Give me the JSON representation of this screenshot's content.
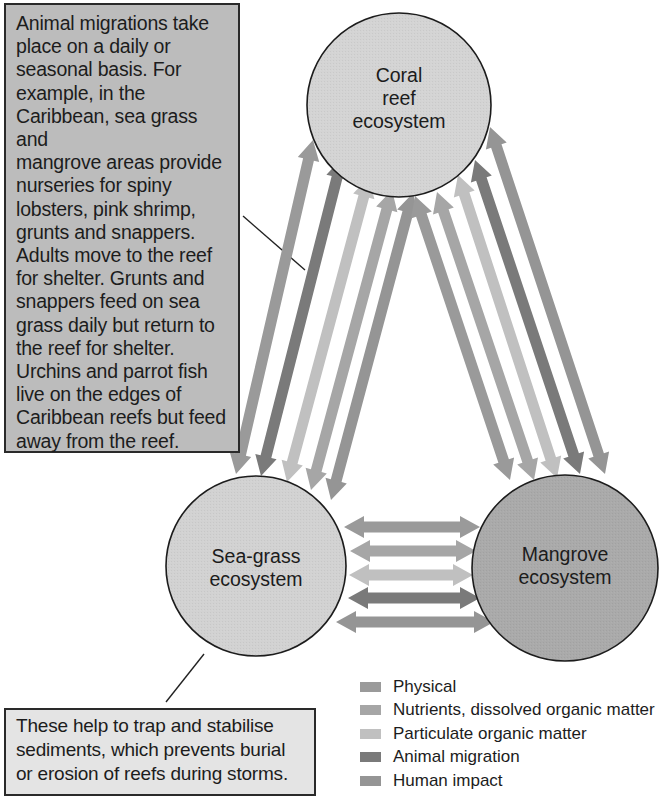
{
  "nodes": {
    "coral": {
      "label_lines": [
        "Coral",
        "reef",
        "ecosystem"
      ],
      "fill": "#d3d3d3"
    },
    "seagrass": {
      "label_lines": [
        "Sea-grass",
        "ecosystem"
      ],
      "fill": "#d1d1d1"
    },
    "mangrove": {
      "label_lines": [
        "Mangrove",
        "ecosystem"
      ],
      "fill": "#a9a9a9"
    }
  },
  "callouts": {
    "top": {
      "lines": [
        "Animal migrations take",
        "place on a daily or",
        "seasonal basis. For",
        "example, in the",
        "Caribbean, sea grass and",
        "mangrove areas provide",
        "nurseries for spiny",
        "lobsters, pink shrimp,",
        "grunts and snappers.",
        "Adults move to the reef",
        "for shelter. Grunts and",
        "snappers feed on sea",
        "grass daily but return to",
        "the reef for shelter.",
        "Urchins and parrot fish",
        "live on the edges of",
        "Caribbean reefs but feed",
        "away from the reef."
      ]
    },
    "bottom": {
      "lines": [
        "These help to trap and stabilise",
        "sediments, which prevents burial",
        "or erosion of reefs during storms."
      ]
    }
  },
  "legend": {
    "items": [
      {
        "label": "Physical",
        "color": "#9a9a9a"
      },
      {
        "label": "Nutrients, dissolved organic matter",
        "color": "#a6a6a6"
      },
      {
        "label": "Particulate organic matter",
        "color": "#c0c0c0"
      },
      {
        "label": "Animal migration",
        "color": "#7a7a7a"
      },
      {
        "label": "Human impact",
        "color": "#959595"
      }
    ]
  },
  "flows": {
    "categories": [
      "Physical",
      "Nutrients, dissolved organic matter",
      "Particulate organic matter",
      "Animal migration",
      "Human impact"
    ],
    "connections": [
      {
        "from": "Sea-grass ecosystem",
        "to": "Coral reef ecosystem",
        "bidirectional": true,
        "arrow_count": 5
      },
      {
        "from": "Coral reef ecosystem",
        "to": "Mangrove ecosystem",
        "bidirectional": true,
        "arrow_count": 5
      },
      {
        "from": "Sea-grass ecosystem",
        "to": "Mangrove ecosystem",
        "bidirectional": true,
        "arrow_count": 5
      }
    ]
  }
}
